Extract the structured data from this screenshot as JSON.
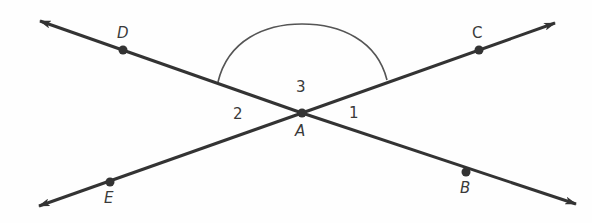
{
  "diagram": {
    "type": "intersecting-lines",
    "intersection_point": "A",
    "points": [
      {
        "id": "A",
        "label": "A",
        "x": 302,
        "y": 113
      },
      {
        "id": "B",
        "label": "B",
        "x": 466,
        "y": 172
      },
      {
        "id": "C",
        "label": "C",
        "x": 479,
        "y": 50
      },
      {
        "id": "D",
        "label": "D",
        "x": 123,
        "y": 50
      },
      {
        "id": "E",
        "label": "E",
        "x": 110,
        "y": 182
      }
    ],
    "lines": [
      {
        "id": "line-DB",
        "through": [
          "D",
          "A",
          "B"
        ]
      },
      {
        "id": "line-EC",
        "through": [
          "E",
          "A",
          "C"
        ]
      }
    ],
    "angles": [
      {
        "label": "1",
        "between": [
          "B",
          "C"
        ]
      },
      {
        "label": "2",
        "between": [
          "D",
          "E"
        ]
      },
      {
        "label": "3",
        "between": [
          "D",
          "C"
        ],
        "marked_with_arc": true
      }
    ],
    "colors": {
      "line": "#333333",
      "arc": "#555555",
      "text": "#3a3a3a"
    }
  },
  "labels": {
    "A": "A",
    "B": "B",
    "C": "C",
    "D": "D",
    "E": "E",
    "angle1": "1",
    "angle2": "2",
    "angle3": "3"
  }
}
